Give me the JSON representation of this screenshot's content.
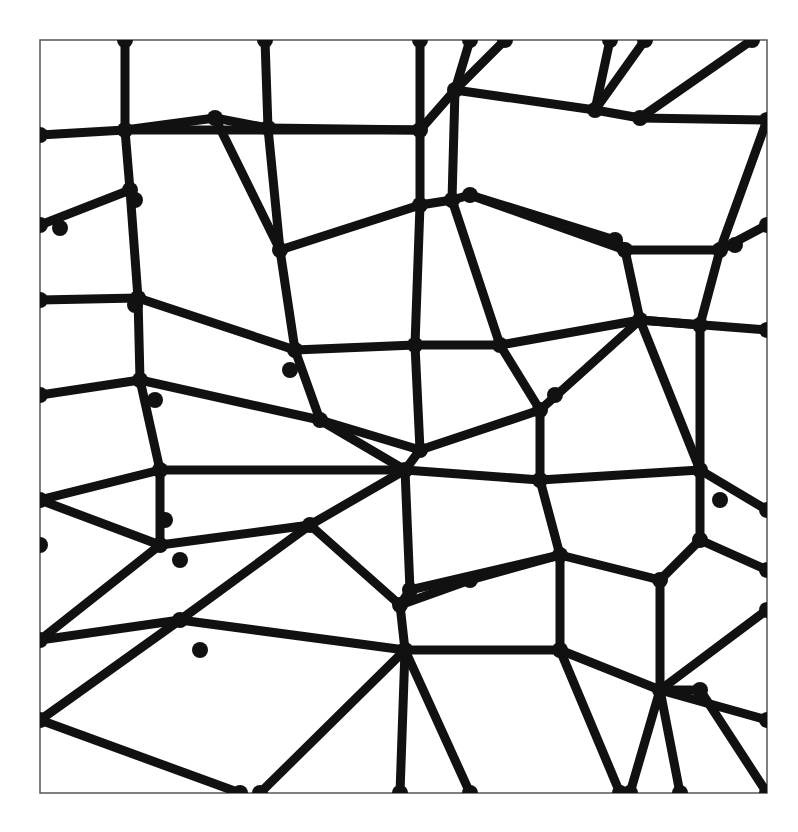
{
  "image": {
    "description": "Black organic Voronoi-style network of thick rounded lines on white, enclosed in a thin square frame",
    "background": "#ffffff",
    "ink": "#111111",
    "frame": {
      "x": 40,
      "y": 40,
      "w": 727,
      "h": 753,
      "stroke": "#555555"
    },
    "stroke_width": 9
  },
  "nodes": {
    "a1": [
      125,
      40
    ],
    "a2": [
      125,
      130
    ],
    "a3": [
      215,
      118
    ],
    "a4": [
      265,
      40
    ],
    "a5": [
      268,
      128
    ],
    "a6": [
      420,
      40
    ],
    "a7": [
      420,
      130
    ],
    "a8": [
      455,
      90
    ],
    "a9": [
      470,
      40
    ],
    "a10": [
      505,
      40
    ],
    "a11": [
      595,
      110
    ],
    "a12": [
      610,
      40
    ],
    "a13": [
      645,
      40
    ],
    "a14": [
      640,
      118
    ],
    "a15": [
      752,
      40
    ],
    "a16": [
      767,
      120
    ],
    "b1": [
      40,
      135
    ],
    "b2": [
      130,
      190
    ],
    "b3": [
      40,
      225
    ],
    "b4": [
      60,
      228
    ],
    "b5": [
      135,
      200
    ],
    "b6": [
      280,
      250
    ],
    "b7": [
      420,
      205
    ],
    "b8": [
      452,
      200
    ],
    "b9": [
      470,
      195
    ],
    "b10": [
      615,
      240
    ],
    "b11": [
      625,
      250
    ],
    "b12": [
      720,
      250
    ],
    "b13": [
      767,
      225
    ],
    "b14": [
      735,
      245
    ],
    "c1": [
      40,
      300
    ],
    "c2": [
      138,
      298
    ],
    "c3": [
      135,
      305
    ],
    "c4": [
      295,
      350
    ],
    "c5": [
      290,
      370
    ],
    "c6": [
      415,
      345
    ],
    "c7": [
      500,
      345
    ],
    "c8": [
      640,
      320
    ],
    "c9": [
      767,
      330
    ],
    "c10": [
      700,
      325
    ],
    "d1": [
      40,
      395
    ],
    "d2": [
      140,
      380
    ],
    "d3": [
      155,
      400
    ],
    "d4": [
      320,
      420
    ],
    "d5": [
      420,
      450
    ],
    "d6": [
      540,
      410
    ],
    "d7": [
      555,
      395
    ],
    "d8": [
      700,
      470
    ],
    "d9": [
      720,
      500
    ],
    "d10": [
      767,
      510
    ],
    "e1": [
      40,
      500
    ],
    "e2": [
      160,
      470
    ],
    "e3": [
      165,
      520
    ],
    "e4": [
      405,
      470
    ],
    "e5": [
      410,
      590
    ],
    "e6": [
      540,
      480
    ],
    "e7": [
      560,
      555
    ],
    "e8": [
      700,
      540
    ],
    "e9": [
      767,
      570
    ],
    "f1": [
      40,
      545
    ],
    "f2": [
      160,
      545
    ],
    "f3": [
      180,
      560
    ],
    "f4": [
      310,
      525
    ],
    "f5": [
      400,
      605
    ],
    "f6": [
      470,
      580
    ],
    "f7": [
      660,
      580
    ],
    "f8": [
      767,
      610
    ],
    "g1": [
      40,
      640
    ],
    "g2": [
      180,
      620
    ],
    "g3": [
      200,
      650
    ],
    "g4": [
      405,
      650
    ],
    "g5": [
      560,
      650
    ],
    "g6": [
      660,
      690
    ],
    "g7": [
      700,
      690
    ],
    "g8": [
      767,
      720
    ],
    "h1": [
      40,
      720
    ],
    "h2": [
      240,
      793
    ],
    "h3": [
      260,
      793
    ],
    "h4": [
      400,
      793
    ],
    "h5": [
      470,
      793
    ],
    "h6": [
      620,
      793
    ],
    "h7": [
      630,
      793
    ],
    "h8": [
      680,
      793
    ],
    "h9": [
      767,
      793
    ]
  },
  "edges": [
    [
      "a1",
      "a2"
    ],
    [
      "a2",
      "b1"
    ],
    [
      "a2",
      "a3"
    ],
    [
      "a3",
      "a5"
    ],
    [
      "a4",
      "a5"
    ],
    [
      "a5",
      "a7"
    ],
    [
      "a6",
      "a7"
    ],
    [
      "a7",
      "a8"
    ],
    [
      "a8",
      "a9"
    ],
    [
      "a8",
      "a10"
    ],
    [
      "a7",
      "b7"
    ],
    [
      "a11",
      "a12"
    ],
    [
      "a11",
      "a13"
    ],
    [
      "a11",
      "a14"
    ],
    [
      "a14",
      "a15"
    ],
    [
      "a14",
      "a16"
    ],
    [
      "a8",
      "a11"
    ],
    [
      "a7",
      "a2"
    ],
    [
      "a2",
      "b2"
    ],
    [
      "b2",
      "b3"
    ],
    [
      "b2",
      "c2"
    ],
    [
      "a3",
      "b6"
    ],
    [
      "a5",
      "b6"
    ],
    [
      "b6",
      "b7"
    ],
    [
      "b7",
      "b8"
    ],
    [
      "b8",
      "a8"
    ],
    [
      "b8",
      "b9"
    ],
    [
      "b9",
      "b10"
    ],
    [
      "b10",
      "b11"
    ],
    [
      "b11",
      "b12"
    ],
    [
      "b12",
      "b13"
    ],
    [
      "b12",
      "a16"
    ],
    [
      "b9",
      "b11"
    ],
    [
      "c1",
      "c2"
    ],
    [
      "c2",
      "c4"
    ],
    [
      "c4",
      "b6"
    ],
    [
      "c4",
      "c6"
    ],
    [
      "c6",
      "c7"
    ],
    [
      "c7",
      "b8"
    ],
    [
      "c6",
      "b7"
    ],
    [
      "c7",
      "c8"
    ],
    [
      "c8",
      "b11"
    ],
    [
      "c8",
      "c9"
    ],
    [
      "c8",
      "c10"
    ],
    [
      "c10",
      "b12"
    ],
    [
      "c2",
      "d2"
    ],
    [
      "d1",
      "d2"
    ],
    [
      "d2",
      "d4"
    ],
    [
      "c4",
      "d4"
    ],
    [
      "d4",
      "d5"
    ],
    [
      "c6",
      "d5"
    ],
    [
      "d5",
      "d6"
    ],
    [
      "d6",
      "c7"
    ],
    [
      "d6",
      "c8"
    ],
    [
      "d6",
      "e6"
    ],
    [
      "d2",
      "e2"
    ],
    [
      "e2",
      "e1"
    ],
    [
      "e2",
      "e4"
    ],
    [
      "d4",
      "e4"
    ],
    [
      "e4",
      "d5"
    ],
    [
      "e4",
      "e5"
    ],
    [
      "e4",
      "e6"
    ],
    [
      "e6",
      "e7"
    ],
    [
      "e6",
      "d8"
    ],
    [
      "d8",
      "c8"
    ],
    [
      "d8",
      "d10"
    ],
    [
      "d8",
      "e8"
    ],
    [
      "d8",
      "c10"
    ],
    [
      "e1",
      "f2"
    ],
    [
      "f2",
      "e2"
    ],
    [
      "f2",
      "f4"
    ],
    [
      "f4",
      "e4"
    ],
    [
      "f2",
      "g1"
    ],
    [
      "f4",
      "f5"
    ],
    [
      "f5",
      "e5"
    ],
    [
      "f5",
      "f6"
    ],
    [
      "f6",
      "e7"
    ],
    [
      "e7",
      "f7"
    ],
    [
      "f7",
      "e8"
    ],
    [
      "e8",
      "e9"
    ],
    [
      "e7",
      "e5"
    ],
    [
      "g1",
      "g2"
    ],
    [
      "g2",
      "f4"
    ],
    [
      "g2",
      "g4"
    ],
    [
      "g4",
      "f5"
    ],
    [
      "g2",
      "h1"
    ],
    [
      "g4",
      "h4"
    ],
    [
      "g4",
      "g5"
    ],
    [
      "g5",
      "e7"
    ],
    [
      "g5",
      "g6"
    ],
    [
      "g6",
      "f7"
    ],
    [
      "g6",
      "f8"
    ],
    [
      "g6",
      "g8"
    ],
    [
      "g6",
      "h8"
    ],
    [
      "g5",
      "h6"
    ],
    [
      "g6",
      "h7"
    ],
    [
      "h1",
      "h2"
    ],
    [
      "g4",
      "h3"
    ],
    [
      "g4",
      "h5"
    ],
    [
      "g6",
      "g7"
    ],
    [
      "g7",
      "h9"
    ]
  ]
}
